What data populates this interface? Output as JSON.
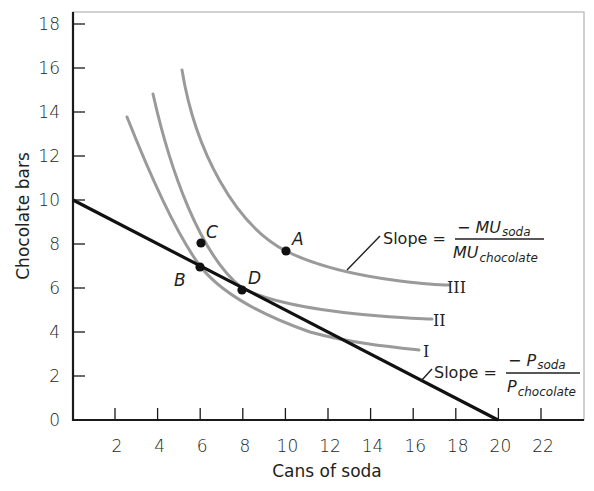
{
  "chart_data": {
    "type": "line",
    "title": "",
    "xlabel": "Cans of soda",
    "ylabel": "Chocolate bars",
    "xlim": [
      0,
      24
    ],
    "ylim": [
      0,
      18
    ],
    "x_ticks": [
      "2",
      "4",
      "6",
      "8",
      "10",
      "12",
      "14",
      "16",
      "18",
      "20",
      "22"
    ],
    "y_ticks": [
      "0",
      "2",
      "4",
      "6",
      "8",
      "10",
      "12",
      "14",
      "16",
      "18"
    ],
    "grid": false,
    "legend": "none",
    "series": [
      {
        "name": "Budget line",
        "color": "#000000",
        "points": [
          [
            0,
            10
          ],
          [
            20,
            0
          ]
        ],
        "annotation": {
          "text": "Slope =",
          "numerator": "− P",
          "numerator_sub": "soda",
          "denominator": "P",
          "denominator_sub": "chocolate"
        }
      },
      {
        "name": "I",
        "color": "#9a9a9a",
        "points": [
          [
            2.5,
            13.8
          ],
          [
            4,
            10.2
          ],
          [
            6,
            7
          ],
          [
            8,
            5.1
          ],
          [
            10,
            4.2
          ],
          [
            13,
            3.6
          ],
          [
            16.3,
            3.2
          ]
        ]
      },
      {
        "name": "II",
        "color": "#9a9a9a",
        "points": [
          [
            3.8,
            14.8
          ],
          [
            5,
            11
          ],
          [
            6.5,
            8
          ],
          [
            8,
            6
          ],
          [
            10,
            5.3
          ],
          [
            13,
            4.9
          ],
          [
            16.9,
            4.6
          ]
        ]
      },
      {
        "name": "III",
        "color": "#9a9a9a",
        "points": [
          [
            5.2,
            16
          ],
          [
            6.5,
            12
          ],
          [
            8,
            9.3
          ],
          [
            10,
            7.6
          ],
          [
            12,
            6.9
          ],
          [
            15,
            6.4
          ],
          [
            17.7,
            6.1
          ]
        ],
        "annotation": {
          "text": "Slope =",
          "numerator": "− MU",
          "numerator_sub": "soda",
          "denominator": "MU",
          "denominator_sub": "chocolate"
        }
      }
    ],
    "points": [
      {
        "label": "A",
        "x": 10,
        "y": 7.6,
        "curve": "III"
      },
      {
        "label": "B",
        "x": 6,
        "y": 7,
        "curve": "I"
      },
      {
        "label": "C",
        "x": 6,
        "y": 8,
        "curve": "II"
      },
      {
        "label": "D",
        "x": 8,
        "y": 6,
        "curve": "II"
      }
    ]
  },
  "labels": {
    "xlabel": "Cans of soda",
    "ylabel": "Chocolate bars",
    "curve_I": "I",
    "curve_II": "II",
    "curve_III": "III",
    "point_A": "A",
    "point_B": "B",
    "point_C": "C",
    "point_D": "D",
    "mu_slope": {
      "prefix": "Slope =",
      "num": "− MU",
      "num_sub": "soda",
      "den": "MU",
      "den_sub": "chocolate"
    },
    "p_slope": {
      "prefix": "Slope =",
      "num": "− P",
      "num_sub": "soda",
      "den": "P",
      "den_sub": "chocolate"
    },
    "x_ticks": [
      "2",
      "4",
      "6",
      "8",
      "10",
      "12",
      "14",
      "16",
      "18",
      "20",
      "22"
    ],
    "y_ticks": [
      "0",
      "2",
      "4",
      "6",
      "8",
      "10",
      "12",
      "14",
      "16",
      "18"
    ]
  }
}
